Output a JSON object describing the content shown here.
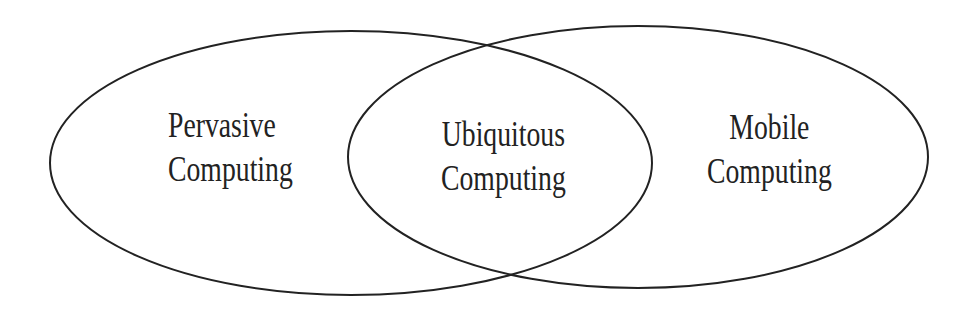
{
  "diagram": {
    "type": "venn",
    "colors": {
      "background": "#ffffff",
      "stroke": "#222222",
      "text": "#222222"
    },
    "sets": [
      {
        "id": "pervasive",
        "ellipse": {
          "cx": 351,
          "cy": 163,
          "rx": 301,
          "ry": 132
        }
      },
      {
        "id": "mobile",
        "ellipse": {
          "cx": 638,
          "cy": 157,
          "rx": 290,
          "ry": 131
        }
      }
    ],
    "labels": {
      "pervasive": {
        "line1": "Pervasive",
        "line2": "Computing"
      },
      "ubiquitous": {
        "line1": "Ubiquitous",
        "line2": "Computing"
      },
      "mobile": {
        "line1": "Mobile",
        "line2": "Computing"
      }
    }
  }
}
